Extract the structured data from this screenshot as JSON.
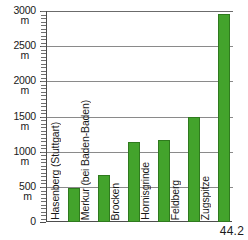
{
  "chart_data": {
    "type": "bar",
    "title": "",
    "xlabel": "",
    "ylabel": "",
    "yunit": "m",
    "ylim": [
      0,
      3000
    ],
    "ytick_values": [
      0,
      500,
      1000,
      1500,
      2000,
      2500,
      3000
    ],
    "ytick_labels": [
      "0",
      "500",
      "1000",
      "1500",
      "2000",
      "2500",
      "3000"
    ],
    "grid": true,
    "legend": "none",
    "bar_color": "#43A32C",
    "bar_edge_color": "#2F7A1E",
    "categories": [
      "Hasenberg (Stuttgart)",
      "Merkur (bei Baden-Baden)",
      "Brocken",
      "Hornisgrinde",
      "Feldberg",
      "Zugspitze"
    ],
    "values": [
      480,
      670,
      1142,
      1164,
      1493,
      2962
    ]
  },
  "axis": {
    "ticks": [
      {
        "label": "3000",
        "unit": "m",
        "value": 3000
      },
      {
        "label": "2500",
        "unit": "m",
        "value": 2500
      },
      {
        "label": "2000",
        "unit": "m",
        "value": 2000
      },
      {
        "label": "1500",
        "unit": "m",
        "value": 1500
      },
      {
        "label": "1000",
        "unit": "m",
        "value": 1000
      },
      {
        "label": "500",
        "unit": "m",
        "value": 500
      },
      {
        "label": "0",
        "unit": "",
        "value": 0
      }
    ]
  },
  "footer": {
    "figure_number": "44.2"
  }
}
